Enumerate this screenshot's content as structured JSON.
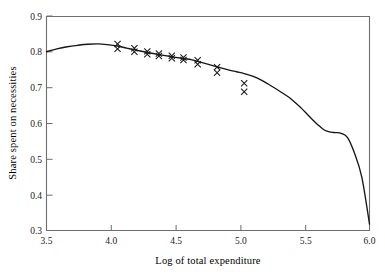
{
  "chart_data": {
    "type": "line",
    "title": "",
    "subtitle": "",
    "xlabel": "Log of total expenditure",
    "ylabel": "Share spent on necessities",
    "xlim": [
      3.5,
      6.0
    ],
    "ylim": [
      0.3,
      0.9
    ],
    "xticks": [
      3.5,
      4.0,
      4.5,
      5.0,
      5.5,
      6.0
    ],
    "xticklabels": [
      "3.5",
      "4.0",
      "4.5",
      "5.0",
      "5.5",
      "6.0"
    ],
    "yticks": [
      0.3,
      0.4,
      0.5,
      0.6,
      0.7,
      0.8,
      0.9
    ],
    "yticklabels": [
      "0.3",
      "0.4",
      "0.5",
      "0.6",
      "0.7",
      "0.8",
      "0.9"
    ],
    "grid": false,
    "legend": "none",
    "series": [
      {
        "name": "Nonparametric fit",
        "style": "solid-line",
        "color": "#161616",
        "x": [
          3.5,
          3.58,
          3.66,
          3.74,
          3.82,
          3.9,
          3.97,
          4.05,
          4.12,
          4.2,
          4.28,
          4.37,
          4.47,
          4.56,
          4.62,
          4.67,
          4.74,
          4.82,
          4.9,
          4.97,
          5.03,
          5.1,
          5.17,
          5.25,
          5.32,
          5.4,
          5.47,
          5.54,
          5.6,
          5.65,
          5.7,
          5.74,
          5.78,
          5.83,
          5.88,
          5.94,
          6.0
        ],
        "y": [
          0.8,
          0.808,
          0.814,
          0.818,
          0.821,
          0.822,
          0.82,
          0.816,
          0.81,
          0.804,
          0.798,
          0.792,
          0.786,
          0.781,
          0.778,
          0.773,
          0.766,
          0.758,
          0.75,
          0.744,
          0.739,
          0.731,
          0.719,
          0.702,
          0.686,
          0.666,
          0.643,
          0.617,
          0.596,
          0.581,
          0.575,
          0.574,
          0.572,
          0.56,
          0.52,
          0.45,
          0.318
        ]
      },
      {
        "name": "Observed data points",
        "style": "x-markers",
        "color": "#1a1a1a",
        "points": [
          {
            "x": 4.05,
            "y": 0.822
          },
          {
            "x": 4.05,
            "y": 0.808
          },
          {
            "x": 4.18,
            "y": 0.81
          },
          {
            "x": 4.18,
            "y": 0.8
          },
          {
            "x": 4.28,
            "y": 0.801
          },
          {
            "x": 4.28,
            "y": 0.793
          },
          {
            "x": 4.37,
            "y": 0.795
          },
          {
            "x": 4.37,
            "y": 0.788
          },
          {
            "x": 4.47,
            "y": 0.789
          },
          {
            "x": 4.47,
            "y": 0.782
          },
          {
            "x": 4.56,
            "y": 0.784
          },
          {
            "x": 4.56,
            "y": 0.777
          },
          {
            "x": 4.67,
            "y": 0.776
          },
          {
            "x": 4.67,
            "y": 0.765
          },
          {
            "x": 4.82,
            "y": 0.757
          },
          {
            "x": 4.82,
            "y": 0.741
          },
          {
            "x": 5.03,
            "y": 0.712
          },
          {
            "x": 5.03,
            "y": 0.688
          }
        ]
      }
    ]
  }
}
